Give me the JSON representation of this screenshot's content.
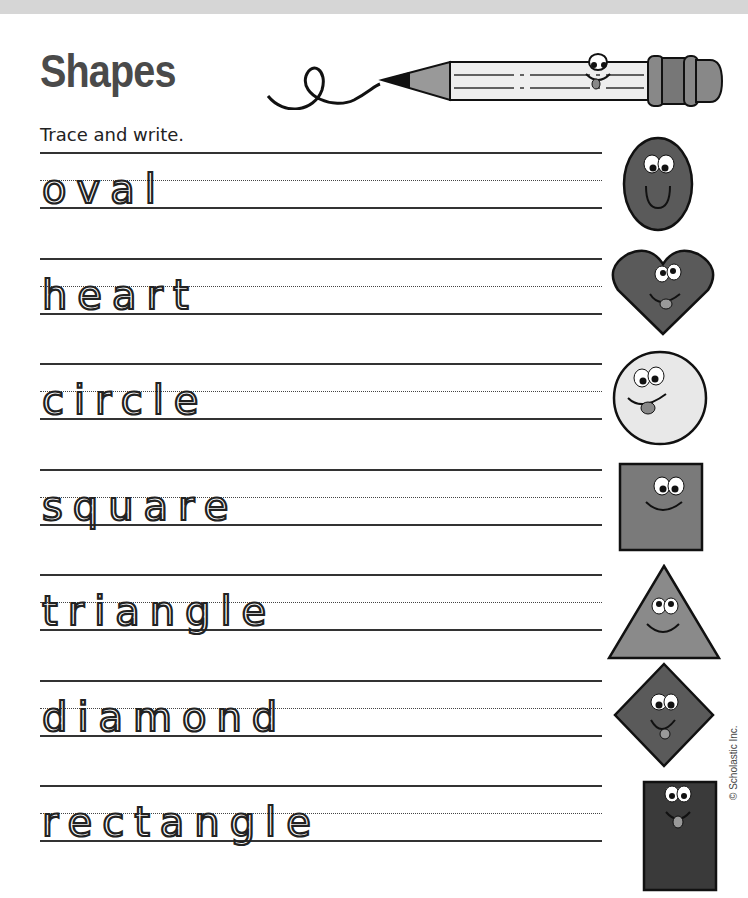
{
  "page": {
    "title": "Shapes",
    "instruction": "Trace and write.",
    "copyright": "© Scholastic Inc."
  },
  "colors": {
    "title": "#4a4a4a",
    "ink": "#222222",
    "shape_dark": "#555555",
    "shape_mid": "#7a7a7a",
    "shape_light": "#e6e6e6",
    "top_band": "#d6d6d6"
  },
  "words": [
    {
      "word": "oval",
      "shape": "oval-icon"
    },
    {
      "word": "heart",
      "shape": "heart-icon"
    },
    {
      "word": "circle",
      "shape": "circle-icon"
    },
    {
      "word": "square",
      "shape": "square-icon"
    },
    {
      "word": "triangle",
      "shape": "triangle-icon"
    },
    {
      "word": "diamond",
      "shape": "diamond-icon"
    },
    {
      "word": "rectangle",
      "shape": "rectangle-icon"
    }
  ]
}
